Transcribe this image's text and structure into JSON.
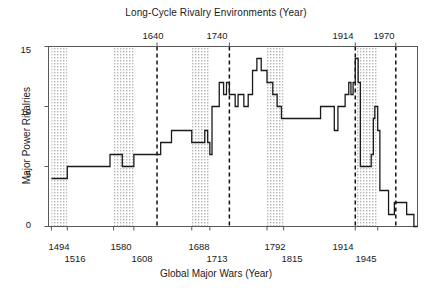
{
  "chart_data": {
    "type": "line",
    "title": "Long-Cycle Rivalry Environments (Year)",
    "xlabel": "Global Major Wars (Year)",
    "ylabel": "Major Power Rivalries",
    "grid": false,
    "legend": "none",
    "xlim": [
      1490,
      2000
    ],
    "ylim": [
      0,
      15
    ],
    "yticks": [
      "0",
      "5",
      "10",
      "15"
    ],
    "ytick_values": [
      0,
      5,
      10,
      15
    ],
    "top_axis": {
      "label": "Long-Cycle Rivalry Environments (Year)",
      "ticks": [
        "1640",
        "1740",
        "1914",
        "1970"
      ],
      "tick_values": [
        1640,
        1740,
        1914,
        1970
      ],
      "style": "dashed vertical lines"
    },
    "bottom_axis": {
      "label": "Global Major Wars (Year)",
      "ticks_upper": [
        "1494",
        "1580",
        "1688",
        "1792",
        "1914"
      ],
      "ticks_lower": [
        "1516",
        "1608",
        "1713",
        "1815",
        "1945"
      ],
      "tick_values_upper": [
        1494,
        1580,
        1688,
        1792,
        1914
      ],
      "tick_values_lower": [
        1516,
        1608,
        1713,
        1815,
        1945
      ]
    },
    "shaded_bands": [
      {
        "start": 1494,
        "end": 1516,
        "label": "1494-1516"
      },
      {
        "start": 1580,
        "end": 1608,
        "label": "1580-1608"
      },
      {
        "start": 1688,
        "end": 1713,
        "label": "1688-1713"
      },
      {
        "start": 1792,
        "end": 1815,
        "label": "1792-1815"
      },
      {
        "start": 1914,
        "end": 1945,
        "label": "1914-1945"
      }
    ],
    "series": [
      {
        "name": "Major Power Rivalries",
        "step": "post",
        "x": [
          1494,
          1516,
          1560,
          1575,
          1592,
          1608,
          1630,
          1645,
          1660,
          1675,
          1688,
          1700,
          1706,
          1710,
          1713,
          1716,
          1720,
          1726,
          1732,
          1736,
          1740,
          1744,
          1748,
          1752,
          1756,
          1760,
          1766,
          1772,
          1778,
          1784,
          1790,
          1792,
          1795,
          1800,
          1806,
          1812,
          1815,
          1830,
          1850,
          1860,
          1866,
          1870,
          1878,
          1885,
          1890,
          1896,
          1900,
          1905,
          1908,
          1911,
          1914,
          1918,
          1921,
          1930,
          1936,
          1939,
          1941,
          1945,
          1948,
          1955,
          1960,
          1968,
          1975,
          1985,
          1995
        ],
        "y": [
          4,
          5,
          5,
          6,
          5,
          6,
          6,
          7,
          8,
          8,
          7,
          7,
          8,
          7,
          6,
          10,
          10,
          12,
          11,
          12,
          11,
          11,
          10,
          11,
          11,
          10,
          11,
          13,
          14,
          13,
          13,
          12,
          12,
          11,
          10,
          9,
          9,
          9,
          9,
          9,
          10,
          10,
          10,
          8,
          10,
          10,
          11,
          12,
          11,
          12,
          14,
          12,
          5,
          5,
          6,
          9,
          10,
          8,
          3,
          3,
          1,
          2,
          2,
          1,
          0
        ]
      }
    ]
  },
  "axis": {
    "y_ticks": [
      "0",
      "5",
      "10",
      "15"
    ],
    "top_ticks": [
      "1640",
      "1740",
      "1914",
      "1970"
    ],
    "bottom_ticks_upper": [
      "1494",
      "1580",
      "1688",
      "1792",
      "1914"
    ],
    "bottom_ticks_lower": [
      "1516",
      "1608",
      "1713",
      "1815",
      "1945"
    ]
  },
  "labels": {
    "title": "Long-Cycle Rivalry Environments (Year)",
    "xlabel": "Global Major Wars (Year)",
    "ylabel": "Major Power Rivalries"
  },
  "colors": {
    "line": "#1a1a1a",
    "band_fill": "#d8d8d8",
    "axis": "#4d4d4d",
    "background": "#ffffff"
  }
}
